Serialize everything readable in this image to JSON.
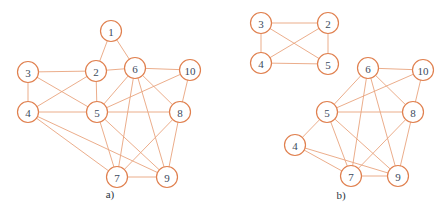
{
  "colors": {
    "node_stroke": "#E0804F",
    "edge": "#E9A47E",
    "label": "#3c4a5c",
    "background": "#ffffff"
  },
  "node_radius": 10.5,
  "graphs": [
    {
      "id": "a",
      "caption": "a)",
      "caption_pos": [
        110,
        198
      ],
      "nodes": [
        {
          "label": "1",
          "x": 111,
          "y": 31
        },
        {
          "label": "2",
          "x": 96,
          "y": 71
        },
        {
          "label": "3",
          "x": 28,
          "y": 72
        },
        {
          "label": "6",
          "x": 135,
          "y": 68
        },
        {
          "label": "10",
          "x": 190,
          "y": 70
        },
        {
          "label": "4",
          "x": 28,
          "y": 112
        },
        {
          "label": "5",
          "x": 97,
          "y": 112
        },
        {
          "label": "8",
          "x": 180,
          "y": 112
        },
        {
          "label": "7",
          "x": 117,
          "y": 177
        },
        {
          "label": "9",
          "x": 167,
          "y": 177
        }
      ],
      "edges": [
        [
          "1",
          "2"
        ],
        [
          "1",
          "6"
        ],
        [
          "3",
          "2"
        ],
        [
          "3",
          "4"
        ],
        [
          "3",
          "5"
        ],
        [
          "2",
          "6"
        ],
        [
          "2",
          "4"
        ],
        [
          "2",
          "5"
        ],
        [
          "6",
          "10"
        ],
        [
          "6",
          "5"
        ],
        [
          "6",
          "7"
        ],
        [
          "6",
          "9"
        ],
        [
          "6",
          "8"
        ],
        [
          "10",
          "5"
        ],
        [
          "10",
          "8"
        ],
        [
          "4",
          "5"
        ],
        [
          "4",
          "7"
        ],
        [
          "4",
          "9"
        ],
        [
          "5",
          "8"
        ],
        [
          "5",
          "7"
        ],
        [
          "5",
          "9"
        ],
        [
          "8",
          "7"
        ],
        [
          "8",
          "9"
        ],
        [
          "7",
          "9"
        ]
      ]
    },
    {
      "id": "b-top",
      "caption": "",
      "nodes": [
        {
          "label": "3",
          "x": 261,
          "y": 23
        },
        {
          "label": "2",
          "x": 328,
          "y": 23
        },
        {
          "label": "4",
          "x": 261,
          "y": 63
        },
        {
          "label": "5",
          "x": 328,
          "y": 64
        }
      ],
      "edges": [
        [
          "3",
          "2"
        ],
        [
          "3",
          "4"
        ],
        [
          "3",
          "5"
        ],
        [
          "2",
          "4"
        ],
        [
          "2",
          "5"
        ],
        [
          "4",
          "5"
        ]
      ]
    },
    {
      "id": "b",
      "caption": "b)",
      "caption_pos": [
        341,
        199
      ],
      "nodes": [
        {
          "label": "6",
          "x": 368,
          "y": 68
        },
        {
          "label": "10",
          "x": 423,
          "y": 70
        },
        {
          "label": "5",
          "x": 327,
          "y": 112
        },
        {
          "label": "8",
          "x": 413,
          "y": 112
        },
        {
          "label": "4",
          "x": 295,
          "y": 145
        },
        {
          "label": "7",
          "x": 351,
          "y": 176
        },
        {
          "label": "9",
          "x": 398,
          "y": 176
        }
      ],
      "edges": [
        [
          "6",
          "10"
        ],
        [
          "6",
          "5"
        ],
        [
          "6",
          "7"
        ],
        [
          "6",
          "9"
        ],
        [
          "6",
          "8"
        ],
        [
          "10",
          "5"
        ],
        [
          "10",
          "8"
        ],
        [
          "5",
          "8"
        ],
        [
          "5",
          "4"
        ],
        [
          "5",
          "7"
        ],
        [
          "5",
          "9"
        ],
        [
          "4",
          "7"
        ],
        [
          "4",
          "9"
        ],
        [
          "8",
          "7"
        ],
        [
          "8",
          "9"
        ],
        [
          "7",
          "9"
        ]
      ]
    }
  ]
}
